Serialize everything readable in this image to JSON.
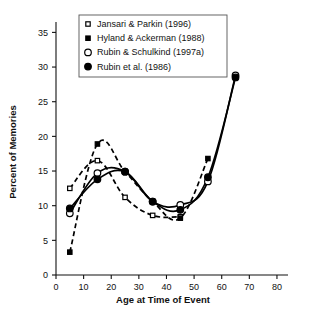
{
  "chart_data": {
    "type": "line",
    "title": "",
    "xlabel": "Age at Time of Event",
    "ylabel": "Percent of Memories",
    "xlim": [
      0,
      84
    ],
    "ylim": [
      0,
      36.5
    ],
    "xticks": [
      0,
      10,
      20,
      30,
      40,
      50,
      60,
      70,
      80
    ],
    "xtick_labels": [
      "0",
      "10",
      "20",
      "30",
      "40",
      "50",
      "60",
      "70",
      "80"
    ],
    "yticks": [
      0,
      5,
      10,
      15,
      20,
      25,
      30,
      35
    ],
    "ytick_labels": [
      "0",
      "5",
      "10",
      "15",
      "20",
      "25",
      "30",
      "35"
    ],
    "grid": false,
    "legend_position": "top-center",
    "x": [
      5,
      15,
      25,
      35,
      45,
      55,
      65
    ],
    "series": [
      {
        "name": "Jansari & Parkin (1996)",
        "marker": "open-square",
        "linestyle": "dashed",
        "x": [
          5,
          15,
          25,
          35,
          45
        ],
        "values": [
          12.5,
          16.5,
          11.2,
          8.6,
          8.4
        ]
      },
      {
        "name": "Hyland & Ackerman (1988)",
        "marker": "filled-square",
        "linestyle": "dashed",
        "x": [
          5,
          15,
          25,
          35,
          45,
          55
        ],
        "values": [
          3.3,
          18.9,
          14.9,
          10.6,
          8.2,
          16.8
        ]
      },
      {
        "name": "Rubin & Schulkind (1997a)",
        "marker": "open-circle",
        "linestyle": "solid",
        "x": [
          5,
          15,
          25,
          35,
          45,
          55,
          65
        ],
        "values": [
          8.9,
          14.7,
          14.9,
          10.6,
          10.1,
          13.5,
          28.8
        ]
      },
      {
        "name": "Rubin et al. (1986)",
        "marker": "filled-circle",
        "linestyle": "solid",
        "x": [
          5,
          15,
          25,
          35,
          45,
          55,
          65
        ],
        "values": [
          9.6,
          13.8,
          14.9,
          10.6,
          9.4,
          14.1,
          28.5
        ]
      }
    ],
    "legend_entries": [
      {
        "label": "Jansari & Parkin (1996)",
        "marker": "open-square"
      },
      {
        "label": "Hyland & Ackerman (1988)",
        "marker": "filled-square"
      },
      {
        "label": "Rubin & Schulkind (1997a)",
        "marker": "open-circle"
      },
      {
        "label": "Rubin et al. (1986)",
        "marker": "filled-circle"
      }
    ],
    "colors": {
      "ink": "#000000",
      "background": "#ffffff",
      "legend_border": "#555555"
    }
  }
}
